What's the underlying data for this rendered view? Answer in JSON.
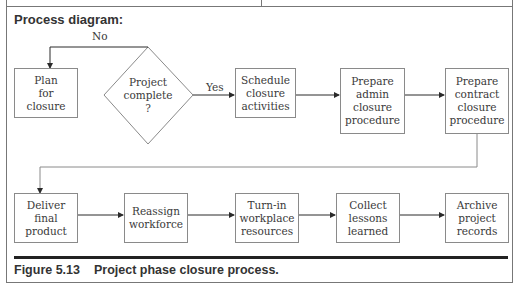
{
  "section": {
    "title": "Process diagram:"
  },
  "decision": {
    "label": "Project\ncomplete\n?",
    "no_label": "No",
    "yes_label": "Yes"
  },
  "row1": [
    {
      "id": "plan",
      "label": "Plan\nfor\nclosure"
    },
    {
      "id": "schedule",
      "label": "Schedule\nclosure\nactivities"
    },
    {
      "id": "admin",
      "label": "Prepare\nadmin\nclosure\nprocedure"
    },
    {
      "id": "contract",
      "label": "Prepare\ncontract\nclosure\nprocedure"
    }
  ],
  "row2": [
    {
      "id": "deliver",
      "label": "Deliver\nfinal\nproduct"
    },
    {
      "id": "reassign",
      "label": "Reassign\nworkforce"
    },
    {
      "id": "turnin",
      "label": "Turn-in\nworkplace\nresources"
    },
    {
      "id": "lessons",
      "label": "Collect\nlessons\nlearned"
    },
    {
      "id": "archive",
      "label": "Archive\nproject\nrecords"
    }
  ],
  "caption": {
    "number": "Figure 5.13",
    "text": "Project phase closure process."
  },
  "colors": {
    "line": "#2b2b2b",
    "box_border": "#8a8a8a",
    "frame": "#777777"
  }
}
